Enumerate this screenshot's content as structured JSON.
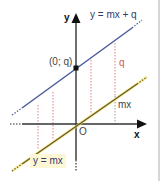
{
  "diagram": {
    "colors": {
      "line_shifted": "#4a5a9a",
      "line_origin": "#6b5a1e",
      "line_origin_glow": "#f5e36a",
      "axis": "#222222",
      "red_dotted": "#e28080",
      "gray_dotted": "#9a9a9a",
      "label_bg": "#fdf7d6"
    },
    "labels": {
      "y_axis": "y",
      "x_axis": "x",
      "origin": "O",
      "line_shifted": "y = mx + q",
      "line_origin": "y = mx",
      "intercept_point": "(0; q)",
      "q_segment": "q",
      "mx_segment": "mx"
    }
  }
}
